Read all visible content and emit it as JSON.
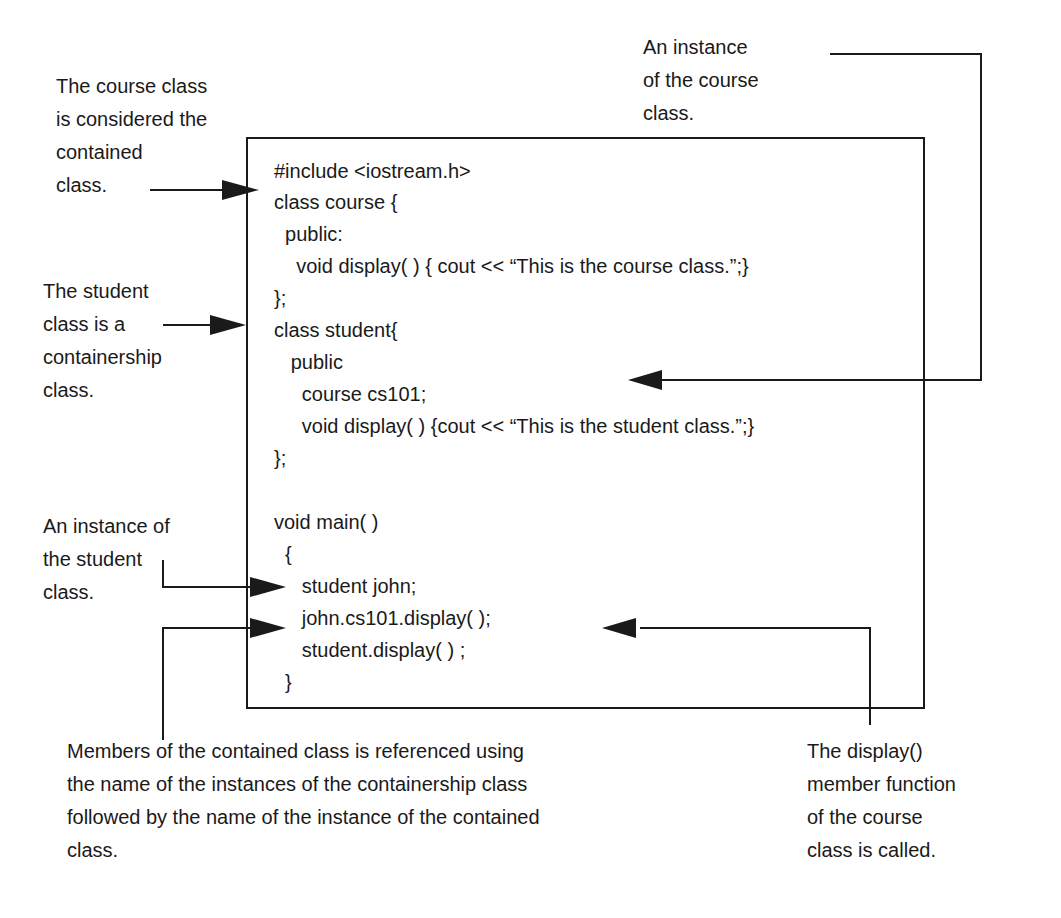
{
  "figure": {
    "topic": "C++ containership example",
    "colors": {
      "ink": "#1a1a1a",
      "background": "#ffffff"
    }
  },
  "annotations": {
    "course_contained": "The course class\nis considered the\ncontained\nclass.",
    "course_instance": "An instance\nof the course\nclass.",
    "student_containership": "The student\nclass is a\ncontainership\nclass.",
    "student_instance": "An instance of\nthe student\nclass.",
    "members_referenced": "Members of the contained class is referenced using\nthe name of the instances of the containership class\nfollowed by the name of the instance of the contained\nclass.",
    "display_called": "The display()\nmember function\nof the course\nclass is called."
  },
  "code": {
    "lines": [
      "#include <iostream.h>",
      "class course {",
      "  public:",
      "    void display( ) { cout << “This is the course class.”;}",
      "};",
      "class student{",
      "   public",
      "     course cs101;",
      "     void display( ) {cout << “This is the student class.”;}",
      "};",
      "",
      "void main( )",
      "  {",
      "     student john;",
      "     john.cs101.display( );",
      "     student.display( ) ;",
      "  }"
    ]
  }
}
